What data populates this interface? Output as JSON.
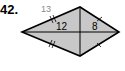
{
  "problem": {
    "number": "42.",
    "figure": "kite",
    "labels": {
      "side_top_left": "13",
      "left_half_diagonal": "12",
      "right_half_diagonal": "8"
    },
    "colors": {
      "fill": "#c8c8c8",
      "stroke": "#000000",
      "side_label": "#8a8a8a"
    }
  }
}
